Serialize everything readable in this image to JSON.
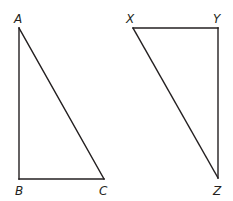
{
  "diagram": {
    "type": "geometry-figure",
    "triangles": [
      {
        "name": "ABC",
        "vertices": [
          "A",
          "B",
          "C"
        ],
        "right_angle_at": "B",
        "edges": [
          "AB",
          "BC",
          "CA"
        ]
      },
      {
        "name": "XYZ",
        "vertices": [
          "X",
          "Y",
          "Z"
        ],
        "right_angle_at": "Y",
        "edges": [
          "XY",
          "YZ",
          "ZX"
        ]
      }
    ],
    "labels": {
      "A": "A",
      "B": "B",
      "C": "C",
      "X": "X",
      "Y": "Y",
      "Z": "Z"
    },
    "colors": {
      "stroke": "#231f20",
      "background": "#ffffff"
    }
  }
}
